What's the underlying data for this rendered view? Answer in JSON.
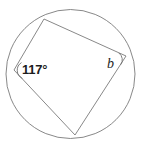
{
  "figure": {
    "kind": "cyclic-quadrilateral-diagram",
    "background_color": "#ffffff",
    "stroke_color": "#7a7a7a",
    "text_color": "#1d1d1d",
    "stroke_width": 0.9,
    "width": 141,
    "height": 148
  },
  "circle": {
    "name": "circumscribed-circle",
    "center_x": 70.5,
    "center_y": 74,
    "radius": 64.5
  },
  "quadrilateral": {
    "name": "inscribed-quadrilateral",
    "vertices": [
      {
        "name": "vertex-top-left",
        "x": 44,
        "y": 19
      },
      {
        "name": "vertex-right",
        "x": 126,
        "y": 56
      },
      {
        "name": "vertex-bottom",
        "x": 75,
        "y": 135
      },
      {
        "name": "vertex-left",
        "x": 14,
        "y": 70
      }
    ],
    "path": "M 44 19 L 126 56 L 75 135 L 14 70 Z"
  },
  "angle_marks": [
    {
      "name": "angle-arc-117",
      "at_vertex": "vertex-left",
      "path": "M 21.5 62.6 A 9 9 0 0 0 22.4 78.4"
    },
    {
      "name": "angle-arc-b",
      "at_vertex": "vertex-right",
      "path": "M 118.9 53.0 A 8.5 8.5 0 0 1 120.8 64.6"
    }
  ],
  "labels": {
    "angle_value": "117°",
    "angle_variable": "b"
  }
}
